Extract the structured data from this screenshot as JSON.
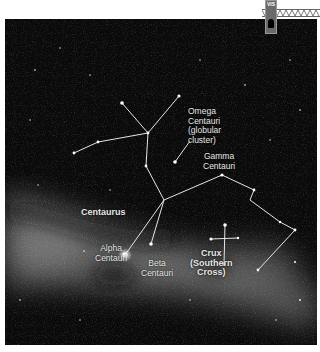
{
  "figure": {
    "background_color": "#0a0a0a",
    "line_color": "#e6e6e6",
    "labels": {
      "centaurus": "Centaurus",
      "omega": "Omega\nCentauri\n(globular\ncluster)",
      "gamma": "Gamma\nCentauri",
      "alpha": "Alpha\nCentauri",
      "beta": "Beta\nCentauri",
      "crux": "Crux\n(Southern\nCross)"
    }
  },
  "widget": {
    "tab_label": "VIS",
    "icon": "slider-handle-icon"
  }
}
